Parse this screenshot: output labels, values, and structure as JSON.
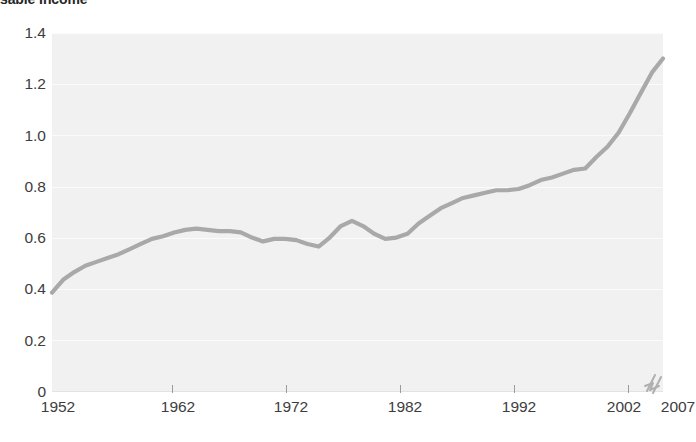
{
  "chart_data": {
    "type": "line",
    "title": "sable Income",
    "xlabel": "",
    "ylabel": "",
    "xlim": [
      1952,
      2007
    ],
    "ylim": [
      0,
      1.4
    ],
    "grid": true,
    "legend": "none",
    "x_tick_labels": [
      "1952",
      "1962",
      "1972",
      "1982",
      "1992",
      "2002",
      "2007"
    ],
    "x_tick_values": [
      1952,
      1962,
      1972,
      1982,
      1992,
      2002,
      2007
    ],
    "y_tick_labels": [
      "0",
      "0.2",
      "0.4",
      "0.6",
      "0.8",
      "1.0",
      "1.2",
      "1.4"
    ],
    "y_tick_values": [
      0,
      0.2,
      0.4,
      0.6,
      0.8,
      1.0,
      1.2,
      1.4
    ],
    "annotations": [
      "axis-break between 2002 and 2007"
    ],
    "series": [
      {
        "name": "Household Debt to Disposable Income",
        "color": "#a9a9a9",
        "x": [
          1952,
          1953,
          1954,
          1955,
          1956,
          1957,
          1958,
          1959,
          1960,
          1961,
          1962,
          1963,
          1964,
          1965,
          1966,
          1967,
          1968,
          1969,
          1970,
          1971,
          1972,
          1973,
          1974,
          1975,
          1976,
          1977,
          1978,
          1979,
          1980,
          1981,
          1982,
          1983,
          1984,
          1985,
          1986,
          1987,
          1988,
          1989,
          1990,
          1991,
          1992,
          1993,
          1994,
          1995,
          1996,
          1997,
          1998,
          1999,
          2000,
          2001,
          2002,
          2003,
          2004,
          2005,
          2006,
          2007
        ],
        "values": [
          0.385,
          0.435,
          0.465,
          0.49,
          0.505,
          0.52,
          0.535,
          0.555,
          0.575,
          0.595,
          0.605,
          0.62,
          0.63,
          0.635,
          0.63,
          0.625,
          0.625,
          0.62,
          0.6,
          0.585,
          0.595,
          0.595,
          0.59,
          0.575,
          0.565,
          0.6,
          0.645,
          0.665,
          0.645,
          0.615,
          0.595,
          0.6,
          0.615,
          0.655,
          0.685,
          0.715,
          0.735,
          0.755,
          0.765,
          0.775,
          0.785,
          0.785,
          0.79,
          0.805,
          0.825,
          0.835,
          0.85,
          0.865,
          0.87,
          0.915,
          0.955,
          1.01,
          1.085,
          1.165,
          1.245,
          1.3
        ]
      }
    ]
  },
  "axis_break": {
    "icon": "zigzag-axis-break-icon"
  }
}
